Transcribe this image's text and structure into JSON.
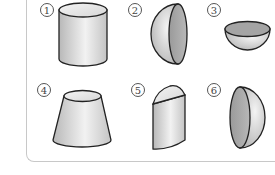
{
  "figure": {
    "items": [
      {
        "number": "1",
        "shape": "cylinder"
      },
      {
        "number": "2",
        "shape": "hemisphere-flat-face-right"
      },
      {
        "number": "3",
        "shape": "hemisphere-bowl-flat-face-up"
      },
      {
        "number": "4",
        "shape": "truncated-cone-frustum"
      },
      {
        "number": "5",
        "shape": "half-cylinder"
      },
      {
        "number": "6",
        "shape": "hemisphere-flat-face-left"
      }
    ]
  },
  "colors": {
    "outline": "#222222",
    "surface_light": "#e8e8e8",
    "surface_dark": "#a8a8a8",
    "frame": "#c8c8c8"
  }
}
